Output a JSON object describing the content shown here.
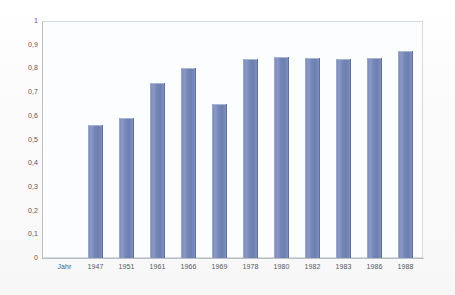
{
  "chart_data": {
    "type": "bar",
    "title": "",
    "subtitle": "",
    "xlabel": "",
    "ylabel": "",
    "category_axis_label": "Jahr",
    "categories": [
      "1947",
      "1951",
      "1961",
      "1966",
      "1969",
      "1978",
      "1980",
      "1982",
      "1983",
      "1986",
      "1988"
    ],
    "values": [
      0.56,
      0.59,
      0.74,
      0.8,
      0.65,
      0.84,
      0.85,
      0.845,
      0.84,
      0.845,
      0.875
    ],
    "series": [
      {
        "name": "",
        "values": [
          0.56,
          0.59,
          0.74,
          0.8,
          0.65,
          0.84,
          0.85,
          0.845,
          0.84,
          0.845,
          0.875
        ]
      }
    ],
    "ylim": [
      0,
      1
    ],
    "ytick_values": [
      1,
      0.9,
      0.8,
      0.7,
      0.6,
      0.5,
      0.4,
      0.3,
      0.2,
      0.1,
      0
    ],
    "ytick_labels": [
      "1",
      "0,9",
      "0,8",
      "0,7",
      "0,6",
      "0,5",
      "0,4",
      "0,3",
      "0,2",
      "0,1",
      "0"
    ],
    "grid": false,
    "legend": false,
    "legend_position": "none",
    "bar_color": "#7385b6",
    "plot_border_color": "#d6d9dd",
    "plot_background": "#fcfdfe",
    "axis_text_color": "#55585d",
    "decimal_separator": ","
  }
}
